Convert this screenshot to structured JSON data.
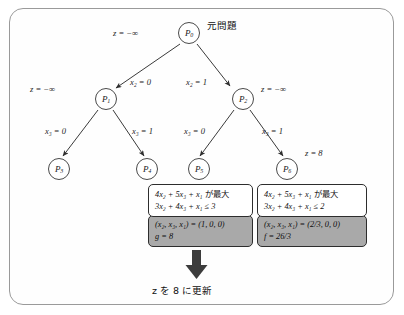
{
  "figure": {
    "type": "branch-and-bound-tree",
    "root_annotation_jp": "元問題",
    "update_caption": {
      "var": "z",
      "text_before": "を",
      "value": "8",
      "text_after": "に更新",
      "full": "z を 8 に更新"
    }
  },
  "nodes": [
    {
      "id": "P0",
      "base": "P",
      "sub": "0",
      "x": 178,
      "y": 22,
      "bound_label": "z = −∞",
      "bound_side": "left"
    },
    {
      "id": "P1",
      "base": "P",
      "sub": "1",
      "x": 95,
      "y": 88,
      "bound_label": "z = −∞",
      "bound_side": "left"
    },
    {
      "id": "P2",
      "base": "P",
      "sub": "2",
      "x": 232,
      "y": 88,
      "bound_label": "z = −∞",
      "bound_side": "right"
    },
    {
      "id": "P3",
      "base": "P",
      "sub": "3",
      "x": 48,
      "y": 158,
      "bound_label": "",
      "bound_side": ""
    },
    {
      "id": "P4",
      "base": "P",
      "sub": "4",
      "x": 136,
      "y": 158,
      "bound_label": "",
      "bound_side": ""
    },
    {
      "id": "P5",
      "base": "P",
      "sub": "5",
      "x": 188,
      "y": 158,
      "bound_label": "",
      "bound_side": ""
    },
    {
      "id": "P6",
      "base": "P",
      "sub": "6",
      "x": 276,
      "y": 158,
      "bound_label": "z = 8",
      "bound_side": "right"
    }
  ],
  "edge_labels": [
    {
      "id": "e01",
      "var": "x",
      "sub": "2",
      "eq": "= 0",
      "text": "x₂ = 0"
    },
    {
      "id": "e02",
      "var": "x",
      "sub": "2",
      "eq": "= 1",
      "text": "x₂ = 1"
    },
    {
      "id": "e13",
      "var": "x",
      "sub": "3",
      "eq": "= 0",
      "text": "x₃ = 0"
    },
    {
      "id": "e14",
      "var": "x",
      "sub": "3",
      "eq": "= 1",
      "text": "x₃ = 1"
    },
    {
      "id": "e25",
      "var": "x",
      "sub": "3",
      "eq": "= 0",
      "text": "x₃ = 0"
    },
    {
      "id": "e26",
      "var": "x",
      "sub": "3",
      "eq": "= 1",
      "text": "x₃ = 1"
    }
  ],
  "bound_labels": {
    "root": "z = −∞",
    "p1": "z = −∞",
    "p2": "z = −∞",
    "p6": "z = 8"
  },
  "left_panel": {
    "objective_prefix": "4x",
    "objective_full": "4x₂ + 5x₃ + x₁",
    "objective_suffix_jp": "が最大",
    "constraint": "3x₂ + 4x₃ + x₁ ≤ 3",
    "constraint_rhs": "3",
    "solution_vars": "(x₂, x₃, x₁)",
    "solution_values": "(1, 0, 0)",
    "solution_line": "(x₂, x₃, x₁) = (1, 0, 0)",
    "value_symbol": "g",
    "value": "8",
    "value_line": "g = 8"
  },
  "right_panel": {
    "objective_full": "4x₂ + 5x₃ + x₁",
    "objective_suffix_jp": "が最大",
    "constraint": "3x₂ + 4x₃ + x₁ ≤ 2",
    "constraint_rhs": "2",
    "solution_vars": "(x₂, x₃, x₁)",
    "solution_values": "(2/3, 0, 0)",
    "solution_line": "(x₂, x₃, x₁) = (2/3, 0, 0)",
    "value_symbol": "f",
    "value": "26/3",
    "value_line": "f = 26/3"
  },
  "colors": {
    "frame_border": "#9a9a9a",
    "node_stroke": "#4a4a4a",
    "edge_stroke": "#3a3a3a",
    "result_box_fill": "#a9a9a9",
    "box_border": "#2d2d2d",
    "arrow_fill": "#3c3c3c",
    "text": "#111111"
  }
}
